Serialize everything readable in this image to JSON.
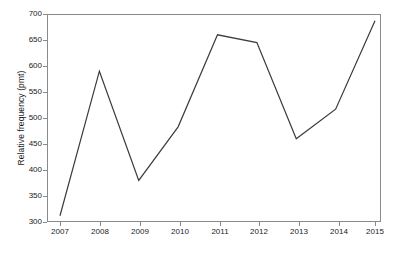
{
  "chart_data": {
    "type": "line",
    "title": "",
    "xlabel": "",
    "ylabel": "Relative frequency (pmt)",
    "categories": [
      "2007",
      "2008",
      "2009",
      "2010",
      "2011",
      "2012",
      "2013",
      "2014",
      "2015"
    ],
    "values": [
      312,
      590,
      380,
      483,
      660,
      645,
      460,
      517,
      687
    ],
    "series": [
      {
        "name": "Relative frequency",
        "values": [
          312,
          590,
          380,
          483,
          660,
          645,
          460,
          517,
          687
        ]
      }
    ],
    "xlim": [
      2007,
      2015
    ],
    "ylim": [
      300,
      700
    ],
    "y_ticks": [
      300,
      350,
      400,
      450,
      500,
      550,
      600,
      650,
      700
    ],
    "x_ticks": [
      "2007",
      "2008",
      "2009",
      "2010",
      "2011",
      "2012",
      "2013",
      "2014",
      "2015"
    ],
    "grid": false,
    "legend": false,
    "legend_position": "none",
    "line_color": "#3b3b3b",
    "frame_color": "#8a8a8a",
    "background_color": "#ffffff"
  },
  "axes": {
    "y_title": "Relative frequency (pmt)",
    "y_tick_labels": [
      "700",
      "650",
      "600",
      "550",
      "500",
      "450",
      "400",
      "350",
      "300"
    ],
    "x_tick_labels": [
      "2007",
      "2008",
      "2009",
      "2010",
      "2011",
      "2012",
      "2013",
      "2014",
      "2015"
    ]
  }
}
